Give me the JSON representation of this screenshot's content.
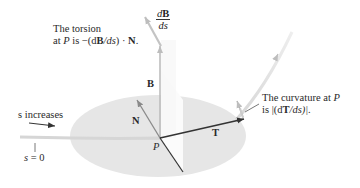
{
  "figure": {
    "type": "frenet-frame-diagram",
    "point_label": "P",
    "vectors": {
      "tangent": "T",
      "normal": "N",
      "binormal": "B",
      "binormal_derivative": {
        "numerator": "dB",
        "denominator": "ds"
      }
    },
    "annotations": {
      "torsion_line1": "The torsion",
      "torsion_line2_prefix": "at ",
      "torsion_line2_P": "P",
      "torsion_line2_mid": " is −(d",
      "torsion_line2_B": "B",
      "torsion_line2_ds": "/ds",
      "torsion_line2_close": ") · ",
      "torsion_line2_N": "N",
      "torsion_line2_end": ".",
      "curvature_line1_prefix": "The curvature at ",
      "curvature_line1_P": "P",
      "curvature_line2_prefix": "is |(d",
      "curvature_line2_T": "T",
      "curvature_line2_end": "/ds)|.",
      "s_increases": "s increases",
      "s_label": "s",
      "s_zero": " = 0"
    },
    "colors": {
      "plane_fill": "#e6e6e6",
      "dark_vector": "#333333",
      "light_vector": "#bdbdbd",
      "curve": "#d9d9d9",
      "text": "#2a2a2a"
    }
  }
}
